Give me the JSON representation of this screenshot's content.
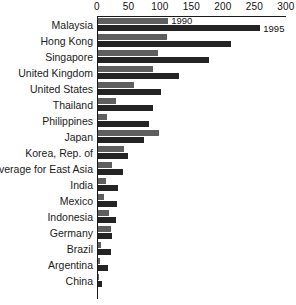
{
  "chart_data": {
    "type": "bar",
    "orientation": "horizontal",
    "title": "",
    "xlabel": "",
    "ylabel": "",
    "xlim": [
      0,
      300
    ],
    "ticks": [
      0,
      50,
      100,
      150,
      200,
      250,
      300
    ],
    "tick_labels": [
      "0",
      "50",
      "100",
      "150",
      "200",
      "250",
      "300"
    ],
    "grid": false,
    "legend_position": "inline-at-bar-end",
    "categories": [
      "Malaysia",
      "Hong Kong",
      "Singapore",
      "United Kingdom",
      "United States",
      "Thailand",
      "Philippines",
      "Japan",
      "Korea, Rep. of",
      "Average for East Asia",
      "India",
      "Mexico",
      "Indonesia",
      "Germany",
      "Brazil",
      "Argentina",
      "China"
    ],
    "series": [
      {
        "name": "1990",
        "color": "#5f5f5f",
        "values": [
          112,
          110,
          95,
          88,
          57,
          28,
          15,
          98,
          42,
          22,
          13,
          10,
          18,
          21,
          4,
          3,
          2
        ]
      },
      {
        "name": "1995",
        "color": "#242424",
        "values": [
          259,
          212,
          177,
          130,
          100,
          88,
          82,
          73,
          48,
          40,
          32,
          30,
          28,
          22,
          20,
          16,
          7
        ]
      }
    ],
    "annotations": [
      {
        "text": "1990",
        "series": "1990",
        "category": "Malaysia"
      },
      {
        "text": "1995",
        "series": "1995",
        "category": "Malaysia"
      }
    ]
  }
}
